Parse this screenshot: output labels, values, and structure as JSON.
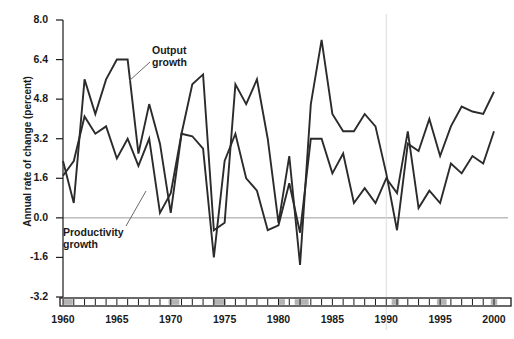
{
  "figure": {
    "background_color": "#ffffff",
    "line_color": "#2b2b2b",
    "zero_line_color": "#9a9a9a",
    "recession_band_color": "#b3b3b3",
    "axis_color": "#1a1a1a"
  },
  "axis": {
    "ylabel": "Annual rate of change (percent)",
    "yticks": [
      "8.0",
      "6.4",
      "4.8",
      "3.2",
      "1.6",
      "0.0",
      "-1.6",
      "-3.2"
    ],
    "ytick_values": [
      8.0,
      6.4,
      4.8,
      3.2,
      1.6,
      0.0,
      -1.6,
      -3.2
    ],
    "xticks": [
      "1960",
      "1965",
      "1970",
      "1975",
      "1980",
      "1985",
      "1990",
      "1995",
      "2000"
    ],
    "xtick_values": [
      1960,
      1965,
      1970,
      1975,
      1980,
      1985,
      1990,
      1995,
      2000
    ],
    "ylim": [
      -3.2,
      8.0
    ],
    "xlim": [
      1960,
      2000
    ]
  },
  "annotations": [
    {
      "name": "output-growth",
      "text": "Output\ngrowth",
      "x": 152,
      "y": 44,
      "leader_from": [
        150,
        62
      ],
      "leader_to": [
        129,
        81
      ]
    },
    {
      "name": "productivity-growth",
      "text": "Productivity\ngrowth",
      "x": 63,
      "y": 226,
      "leader_from": [
        126,
        226
      ],
      "leader_to": [
        146,
        191
      ]
    }
  ],
  "chart_data": {
    "type": "line",
    "title": "",
    "xlabel": "",
    "ylabel": "Annual rate of change (percent)",
    "xlim": [
      1960,
      2000
    ],
    "ylim": [
      -3.2,
      8.0
    ],
    "grid": false,
    "legend_position": "inline-annotation",
    "x": [
      1960,
      1961,
      1962,
      1963,
      1964,
      1965,
      1966,
      1967,
      1968,
      1969,
      1970,
      1971,
      1972,
      1973,
      1974,
      1975,
      1976,
      1977,
      1978,
      1979,
      1980,
      1981,
      1982,
      1983,
      1984,
      1985,
      1986,
      1987,
      1988,
      1989,
      1990,
      1991,
      1992,
      1993,
      1994,
      1995,
      1996,
      1997,
      1998,
      1999,
      2000
    ],
    "series": [
      {
        "name": "Output growth",
        "color": "#2b2b2b",
        "values": [
          2.3,
          0.6,
          5.6,
          4.2,
          5.6,
          6.4,
          6.4,
          2.6,
          4.6,
          3.0,
          0.2,
          3.4,
          5.4,
          5.8,
          -0.5,
          -0.2,
          5.4,
          4.6,
          5.6,
          3.2,
          -0.2,
          2.5,
          -1.9,
          4.6,
          7.2,
          4.2,
          3.5,
          3.5,
          4.2,
          3.7,
          1.8,
          -0.5,
          3.0,
          2.7,
          4.0,
          2.5,
          3.7,
          4.5,
          4.3,
          4.2,
          5.1
        ]
      },
      {
        "name": "Productivity growth",
        "color": "#2b2b2b",
        "values": [
          1.7,
          2.3,
          4.1,
          3.4,
          3.7,
          2.4,
          3.2,
          2.1,
          3.2,
          0.2,
          1.0,
          3.4,
          3.3,
          2.8,
          -1.6,
          2.3,
          3.4,
          1.6,
          1.1,
          -0.5,
          -0.3,
          1.4,
          -0.6,
          3.2,
          3.2,
          1.8,
          2.6,
          0.6,
          1.2,
          0.6,
          1.6,
          1.0,
          3.5,
          0.4,
          1.1,
          0.6,
          2.2,
          1.8,
          2.5,
          2.2,
          3.5
        ]
      }
    ],
    "recession_bands": [
      {
        "start": 1960.0,
        "end": 1960.9
      },
      {
        "start": 1969.8,
        "end": 1970.8
      },
      {
        "start": 1973.9,
        "end": 1975.1
      },
      {
        "start": 1980.0,
        "end": 1980.6
      },
      {
        "start": 1981.5,
        "end": 1982.8
      },
      {
        "start": 1990.5,
        "end": 1991.2
      },
      {
        "start": 1994.7,
        "end": 1995.6
      },
      {
        "start": 1999.7,
        "end": 2000.3
      }
    ]
  }
}
